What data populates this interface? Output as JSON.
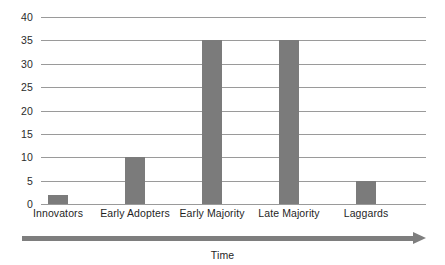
{
  "chart_data": {
    "type": "bar",
    "title": "",
    "subtitle": "",
    "categories": [
      "Innovators",
      "Early Adopters",
      "Early Majority",
      "Late Majority",
      "Laggards"
    ],
    "values": [
      2,
      10,
      35,
      35,
      5
    ],
    "series": [
      {
        "name": "Adoption",
        "values": [
          2,
          10,
          35,
          35,
          5
        ]
      }
    ],
    "xlabel": "Time",
    "ylabel": "",
    "ylim": [
      0,
      40
    ],
    "yticks": [
      0,
      5,
      10,
      15,
      20,
      25,
      30,
      35,
      40
    ],
    "ytick_labels": [
      "0",
      "5",
      "10",
      "15",
      "20",
      "25",
      "30",
      "35",
      "40"
    ],
    "grid": true,
    "grid_axis": "y",
    "legend": false,
    "legend_position": "none",
    "annotations": [
      {
        "name": "time-arrow",
        "text": "",
        "direction": "right"
      }
    ],
    "colors": {
      "bar": "#7b7b7b",
      "gridline": "#9a9a9a",
      "arrow": "#7e7e7e",
      "text": "#1f1f1f",
      "background": "#ffffff"
    }
  }
}
